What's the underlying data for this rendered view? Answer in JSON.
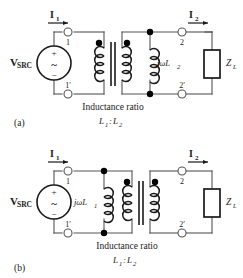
{
  "figure": {
    "type": "circuit-diagram-pair",
    "panels": [
      {
        "tag": "(a)",
        "source_label": "V",
        "source_sub": "SRC",
        "source_plus": "+",
        "source_minus": "−",
        "source_waveform": "~",
        "current_in_label": "I",
        "current_in_sub": "1",
        "current_out_label": "I",
        "current_out_sub": "2",
        "terminal_1": "1",
        "terminal_1p": "1′",
        "terminal_2": "2",
        "terminal_2p": "2′",
        "inductor_label": "jωL",
        "inductor_sub": "2",
        "inductor_side": "secondary",
        "load_label": "Z",
        "load_sub": "L",
        "caption_line1": "Inductance ratio",
        "caption_line2_a": "L",
        "caption_line2_a_sub": "1",
        "caption_line2_sep": ":",
        "caption_line2_b": "L",
        "caption_line2_b_sub": "2"
      },
      {
        "tag": "(b)",
        "source_label": "V",
        "source_sub": "SRC",
        "source_plus": "+",
        "source_minus": "−",
        "source_waveform": "~",
        "current_in_label": "I",
        "current_in_sub": "1",
        "current_out_label": "I",
        "current_out_sub": "2",
        "terminal_1": "1",
        "terminal_1p": "1′",
        "terminal_2": "2",
        "terminal_2p": "2′",
        "inductor_label": "jωL",
        "inductor_sub": "1",
        "inductor_side": "primary",
        "load_label": "Z",
        "load_sub": "L",
        "caption_line1": "Inductance ratio",
        "caption_line2_a": "L",
        "caption_line2_a_sub": "1",
        "caption_line2_sep": ":",
        "caption_line2_b": "L",
        "caption_line2_b_sub": "2"
      }
    ],
    "colors": {
      "ink": "#1a1a1a",
      "wire": "#555555",
      "background": "#ffffff",
      "dot": "#000000"
    }
  }
}
